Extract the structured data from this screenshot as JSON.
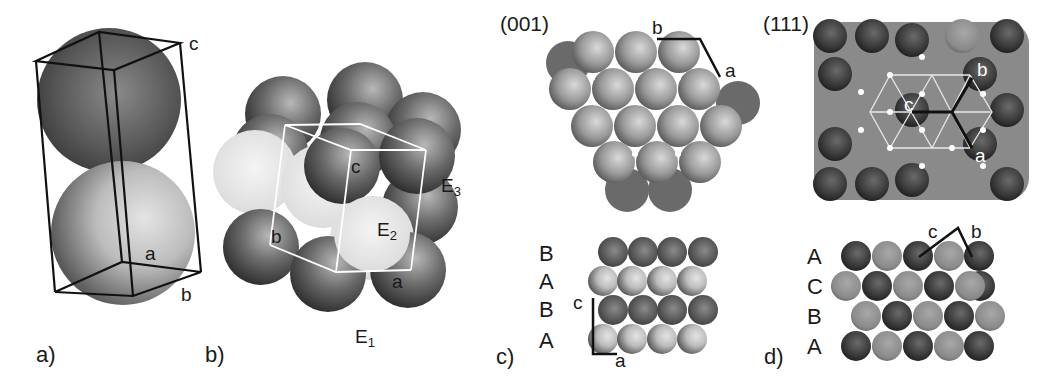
{
  "figure": {
    "panels": [
      {
        "id": "a",
        "label": "a)",
        "axes": {
          "a": "a",
          "b": "b",
          "c": "c"
        }
      },
      {
        "id": "b",
        "label": "b)",
        "axes": {
          "a": "a",
          "b": "b",
          "c": "c"
        },
        "faces": {
          "E1": {
            "base": "E",
            "sub": "1"
          },
          "E2": {
            "base": "E",
            "sub": "2"
          },
          "E3": {
            "base": "E",
            "sub": "3"
          }
        }
      },
      {
        "id": "c",
        "label": "c)",
        "plane": "(001)",
        "axes": {
          "a": "a",
          "b": "b",
          "c": "c",
          "a_side": "a"
        },
        "stacking": [
          "B",
          "A",
          "B",
          "A"
        ]
      },
      {
        "id": "d",
        "label": "d)",
        "plane": "(111)",
        "axes": {
          "a": "a",
          "b": "b",
          "c": "c",
          "c_side": "c",
          "b_side": "b"
        },
        "stacking": [
          "A",
          "C",
          "B",
          "A"
        ]
      }
    ]
  },
  "colors": {
    "dark_sphere": "#555555",
    "mid_sphere": "#8a8a8a",
    "light_sphere": "#d8d8d8",
    "line": "#111111",
    "white_line": "#ffffff"
  }
}
